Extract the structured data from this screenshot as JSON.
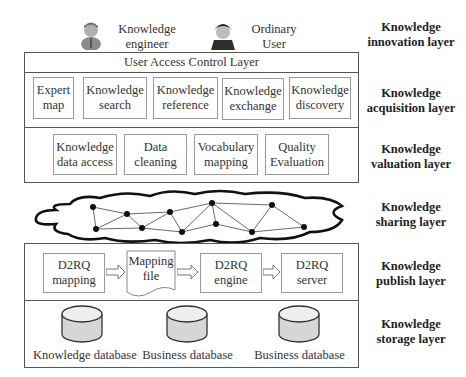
{
  "actors": [
    {
      "name": "knowledge-engineer",
      "label": "Knowledge\nengineer"
    },
    {
      "name": "ordinary-user",
      "label": "Ordinary\nUser"
    }
  ],
  "layers": [
    {
      "id": "innovation",
      "label": "Knowledge\ninnovation layer"
    },
    {
      "id": "acquisition",
      "label": "Knowledge\nacquisition layer"
    },
    {
      "id": "valuation",
      "label": "Knowledge\nvaluation layer"
    },
    {
      "id": "sharing",
      "label": "Knowledge\nsharing layer"
    },
    {
      "id": "publish",
      "label": "Knowledge\npublish layer"
    },
    {
      "id": "storage",
      "label": "Knowledge\nstorage layer"
    }
  ],
  "acquisition": {
    "header": "User Access Control Layer",
    "modules": [
      {
        "label": "Expert\nmap"
      },
      {
        "label": "Knowledge\nsearch"
      },
      {
        "label": "Knowledge\nreference"
      },
      {
        "label": "Knowledge\nexchange"
      },
      {
        "label": "Knowledge\ndiscovery"
      }
    ]
  },
  "valuation": {
    "modules": [
      {
        "label": "Knowledge\ndata access"
      },
      {
        "label": "Data\ncleaning"
      },
      {
        "label": "Vocabulary\nmapping"
      },
      {
        "label": "Quality\nEvaluation"
      }
    ]
  },
  "publish": {
    "steps": [
      {
        "label": "D2RQ\nmapping"
      },
      {
        "label": "Mapping\nfile"
      },
      {
        "label": "D2RQ\nengine"
      },
      {
        "label": "D2RQ\nserver"
      }
    ]
  },
  "storage": {
    "databases": [
      {
        "label": "Knowledge database"
      },
      {
        "label": "Business database"
      },
      {
        "label": "Business database"
      }
    ]
  },
  "colors": {
    "border": "#555555",
    "box_border": "#9a9a9a",
    "db_fill": "#d8d8d8",
    "db_top": "#eeeeee"
  }
}
